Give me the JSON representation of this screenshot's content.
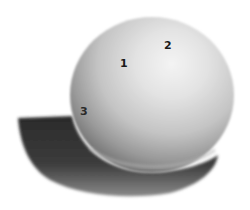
{
  "figure": {
    "labels": [
      {
        "text": "1",
        "x": 120,
        "y": 58
      },
      {
        "text": "2",
        "x": 164,
        "y": 40
      },
      {
        "text": "3",
        "x": 80,
        "y": 106
      }
    ],
    "colors": {
      "background": "#ffffff",
      "highlight": "#f2f2f2",
      "midtone": "#c8c8c8",
      "core_shadow": "#7a7a7a",
      "cast_shadow": "#2a2a2a",
      "label": "#1a1a1a"
    }
  }
}
